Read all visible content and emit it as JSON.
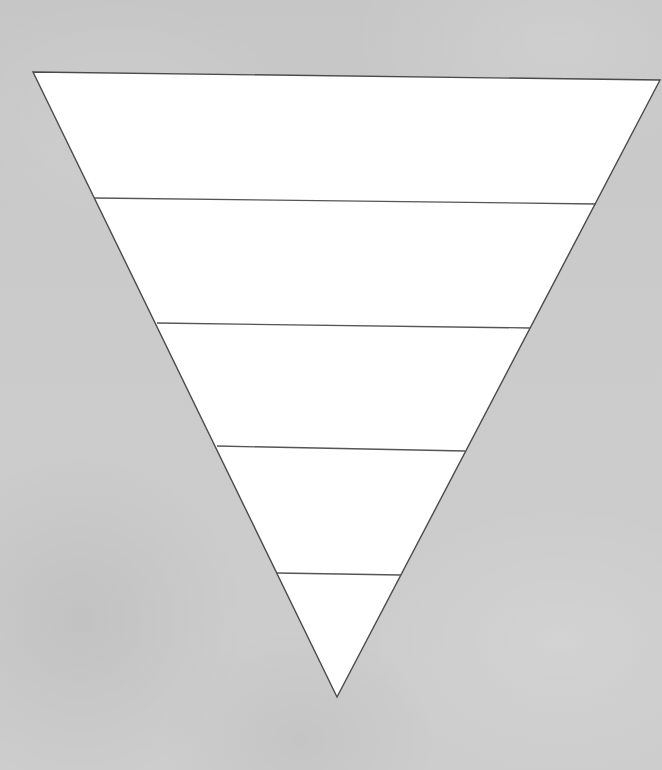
{
  "diagram": {
    "type": "inverted-pyramid",
    "tier_count": 5,
    "tiers": [
      {
        "index": 1,
        "label": ""
      },
      {
        "index": 2,
        "label": ""
      },
      {
        "index": 3,
        "label": ""
      },
      {
        "index": 4,
        "label": ""
      },
      {
        "index": 5,
        "label": ""
      }
    ],
    "colors": {
      "background": "#c9c9c9",
      "fill": "#ffffff",
      "stroke": "#4a4a4a"
    },
    "vertices": {
      "top_left": [
        33,
        72
      ],
      "top_right": [
        660,
        80
      ],
      "bottom": [
        337,
        697
      ]
    },
    "dividers": [
      {
        "from": [
          95,
          198
        ],
        "to": [
          596,
          204
        ]
      },
      {
        "from": [
          157,
          323
        ],
        "to": [
          530,
          328
        ]
      },
      {
        "from": [
          217,
          446
        ],
        "to": [
          465,
          451
        ]
      },
      {
        "from": [
          277,
          573
        ],
        "to": [
          401,
          575
        ]
      }
    ]
  }
}
